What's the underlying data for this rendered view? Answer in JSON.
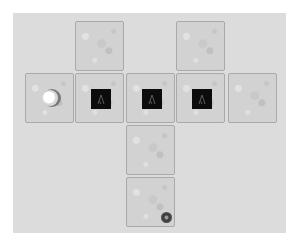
{
  "game": {
    "board": {
      "background_color": "#dcdcdc",
      "tile_color": "#d2d2d2",
      "columns": 5,
      "rows": 4
    },
    "tiles": [
      {
        "id": "tile-r1-c2",
        "row": 1,
        "col": 2,
        "content": "empty"
      },
      {
        "id": "tile-r1-c4",
        "row": 1,
        "col": 4,
        "content": "empty"
      },
      {
        "id": "tile-r2-c1",
        "row": 2,
        "col": 1,
        "content": "player"
      },
      {
        "id": "tile-r2-c2",
        "row": 2,
        "col": 2,
        "content": "block",
        "glyph": "Λ"
      },
      {
        "id": "tile-r2-c3",
        "row": 2,
        "col": 3,
        "content": "block",
        "glyph": "Λ"
      },
      {
        "id": "tile-r2-c4",
        "row": 2,
        "col": 4,
        "content": "block",
        "glyph": "Λ"
      },
      {
        "id": "tile-r2-c5",
        "row": 2,
        "col": 5,
        "content": "empty"
      },
      {
        "id": "tile-r3-c3",
        "row": 3,
        "col": 3,
        "content": "empty"
      },
      {
        "id": "tile-r4-c3",
        "row": 4,
        "col": 3,
        "content": "goal"
      }
    ],
    "pieces": {
      "player": {
        "icon": "sphere-icon",
        "color": "#ffffff",
        "shadow_color": "#6e6e6e"
      },
      "block": {
        "icon": "lambda-arrow-icon",
        "color": "#0c0c0c",
        "glyph_color": "#5a5a5a"
      },
      "goal": {
        "icon": "target-dot-icon",
        "color": "#3a3a3a"
      }
    }
  }
}
